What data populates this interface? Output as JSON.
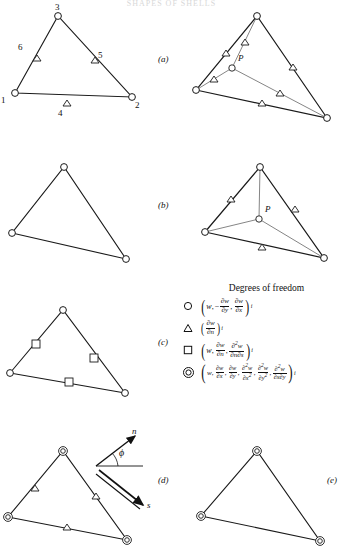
{
  "title_fragment": "SHAPES OF SHELLS",
  "panels": [
    {
      "id": "a",
      "label": "(a)",
      "label_x": 158,
      "label_y": 58
    },
    {
      "id": "b",
      "label": "(b)",
      "label_x": 158,
      "label_y": 204
    },
    {
      "id": "c",
      "label": "(c)",
      "label_x": 158,
      "label_y": 340
    },
    {
      "id": "d",
      "label": "(d)",
      "label_x": 158,
      "label_y": 478
    },
    {
      "id": "e",
      "label": "(e)",
      "label_x": 327,
      "label_y": 478
    }
  ],
  "node_numbers": [
    {
      "text": "3",
      "x": 55,
      "y": 4
    },
    {
      "text": "6",
      "x": 18,
      "y": 47
    },
    {
      "text": "5",
      "x": 97,
      "y": 57
    },
    {
      "text": "1",
      "x": 2,
      "y": 95
    },
    {
      "text": "4",
      "x": 57,
      "y": 104
    },
    {
      "text": "2",
      "x": 133,
      "y": 100
    }
  ],
  "point_labels": [
    {
      "text": "P",
      "x": 236,
      "y": 56
    },
    {
      "text": "P",
      "x": 236,
      "y": 200
    }
  ],
  "vector_labels": [
    {
      "text": "n",
      "x": 129,
      "y": 428
    },
    {
      "text": "ϕ",
      "x": 117,
      "y": 457
    },
    {
      "text": "s",
      "x": 146,
      "y": 502
    }
  ],
  "legend": {
    "title": "Degrees of freedom",
    "rows": [
      {
        "symbol": "circle",
        "symbol_name": "circle-marker",
        "terms": [
          "w",
          "−∂w/∂y",
          "∂w/∂x"
        ],
        "subscript": "i",
        "expression": "(w, −∂w/∂y, ∂w/∂x)ᵢ"
      },
      {
        "symbol": "triangle",
        "symbol_name": "triangle-marker",
        "terms": [
          "∂w/∂n"
        ],
        "subscript": "i",
        "expression": "(∂w/∂n)ᵢ"
      },
      {
        "symbol": "square",
        "symbol_name": "square-marker",
        "terms": [
          "w",
          "∂w/∂n",
          "∂²w/∂n∂s"
        ],
        "subscript": "i",
        "expression": "(w, ∂w/∂n, ∂²w/∂n∂s)ᵢ"
      },
      {
        "symbol": "double-circle",
        "symbol_name": "double-circle-marker",
        "terms": [
          "w",
          "∂w/∂x",
          "∂w/∂y",
          "∂²w/∂x²",
          "∂²w/∂y²",
          "∂²w/∂x∂y"
        ],
        "subscript": "i",
        "expression": "(w, ∂w/∂x, ∂w/∂y, ∂²w/∂x², ∂²w/∂y², ∂²w/∂x∂y)ᵢ"
      }
    ]
  },
  "colors": {
    "line": "#1a1a1a",
    "thin_line": "#555555",
    "background": "#ffffff",
    "text": "#111111"
  }
}
